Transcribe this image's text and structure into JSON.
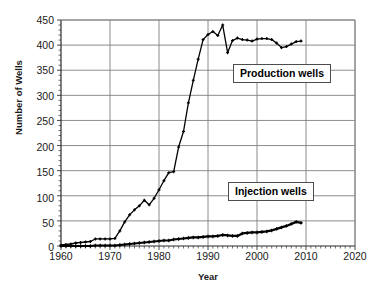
{
  "chart_data": {
    "type": "line",
    "title": "",
    "xlabel": "Year",
    "ylabel": "Number of Wells",
    "xlim": [
      1960,
      2020
    ],
    "ylim": [
      0,
      450
    ],
    "xticks": [
      1960,
      1970,
      1980,
      1990,
      2000,
      2010,
      2020
    ],
    "yticks": [
      0,
      50,
      100,
      150,
      200,
      250,
      300,
      350,
      400,
      450
    ],
    "xminor_step": 1,
    "yminor_step": 10,
    "grid": "horizontal-and-vertical",
    "legend_position": "inside-plot",
    "marker": "plus",
    "line_color": "#000000",
    "grid_color": "#808080",
    "axis_color": "#333333",
    "background": "#ffffff",
    "series": [
      {
        "name": "Production wells",
        "x": [
          1960,
          1961,
          1962,
          1963,
          1964,
          1965,
          1966,
          1967,
          1968,
          1969,
          1970,
          1971,
          1972,
          1973,
          1974,
          1975,
          1976,
          1977,
          1978,
          1979,
          1980,
          1981,
          1982,
          1983,
          1984,
          1985,
          1986,
          1987,
          1988,
          1989,
          1990,
          1991,
          1992,
          1993,
          1994,
          1995,
          1996,
          1997,
          1998,
          1999,
          2000,
          2001,
          2002,
          2003,
          2004,
          2005,
          2006,
          2007,
          2008,
          2009
        ],
        "values": [
          2,
          3,
          4,
          6,
          7,
          8,
          9,
          14,
          14,
          14,
          14,
          15,
          30,
          48,
          62,
          72,
          80,
          91,
          82,
          95,
          112,
          130,
          146,
          148,
          197,
          228,
          285,
          330,
          372,
          411,
          421,
          427,
          419,
          440,
          385,
          409,
          414,
          411,
          410,
          408,
          412,
          413,
          413,
          411,
          404,
          395,
          397,
          402,
          407,
          408
        ]
      },
      {
        "name": "Injection wells",
        "x": [
          1960,
          1961,
          1962,
          1963,
          1964,
          1965,
          1966,
          1967,
          1968,
          1969,
          1970,
          1971,
          1972,
          1973,
          1974,
          1975,
          1976,
          1977,
          1978,
          1979,
          1980,
          1981,
          1982,
          1983,
          1984,
          1985,
          1986,
          1987,
          1988,
          1989,
          1990,
          1991,
          1992,
          1993,
          1994,
          1995,
          1996,
          1997,
          1998,
          1999,
          2000,
          2001,
          2002,
          2003,
          2004,
          2005,
          2006,
          2007,
          2008,
          2009
        ],
        "values": [
          0,
          0,
          0,
          0,
          0,
          0,
          0,
          1,
          1,
          1,
          1,
          1,
          2,
          3,
          4,
          5,
          6,
          7,
          8,
          9,
          10,
          11,
          11,
          13,
          14,
          15,
          16,
          17,
          17,
          18,
          19,
          19,
          20,
          22,
          21,
          20,
          20,
          25,
          26,
          27,
          27,
          28,
          29,
          31,
          34,
          37,
          40,
          44,
          48,
          46
        ]
      }
    ]
  },
  "axes": {
    "y_title": "Number of Wells",
    "x_title": "Year",
    "y_tick_labels": [
      "450",
      "400",
      "350",
      "300",
      "250",
      "200",
      "150",
      "100",
      "50",
      "0"
    ],
    "x_tick_labels": [
      "1960",
      "1970",
      "1980",
      "1990",
      "2000",
      "2010",
      "2020"
    ]
  },
  "legend": {
    "production_label": "Production wells",
    "injection_label": "Injection wells"
  }
}
